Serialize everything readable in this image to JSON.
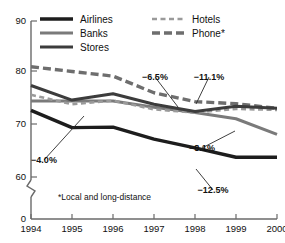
{
  "chart_data": {
    "type": "line",
    "title": "",
    "xlabel": "",
    "ylabel": "",
    "x": [
      "1994",
      "1995",
      "1996",
      "1997",
      "1998",
      "1999",
      "2000"
    ],
    "ylim": [
      60,
      90
    ],
    "axis_break": true,
    "zero_tick": "0",
    "yticks": [
      "90",
      "80",
      "70",
      "60"
    ],
    "ytick_values": [
      90,
      80,
      70,
      60
    ],
    "grid": false,
    "legend_position": "top-center",
    "series": [
      {
        "name": "Airlines",
        "style": "solid",
        "weight": "heavy",
        "color": "#1d1d1d",
        "values": [
          72.8,
          69.5,
          69.6,
          67.3,
          65.6,
          63.8,
          63.8
        ]
      },
      {
        "name": "Banks",
        "style": "solid",
        "weight": "medium",
        "color": "#7a7a7a",
        "values": [
          74.6,
          74.6,
          74.6,
          73.4,
          72.4,
          71.2,
          68.2
        ]
      },
      {
        "name": "Stores",
        "style": "solid",
        "weight": "medium",
        "color": "#3c3c3c",
        "values": [
          77.6,
          74.8,
          76.0,
          74.0,
          72.6,
          73.6,
          73.2
        ]
      },
      {
        "name": "Hotels",
        "style": "dotted",
        "weight": "light",
        "color": "#9a9a9a",
        "values": [
          75.8,
          74.0,
          74.7,
          73.0,
          72.4,
          73.1,
          72.9
        ]
      },
      {
        "name": "Phone*",
        "style": "dashed",
        "weight": "heavy",
        "color": "#6e6e6e",
        "values": [
          81.2,
          80.3,
          79.4,
          76.2,
          74.5,
          74.1,
          73.2
        ]
      }
    ],
    "annotations": [
      {
        "label": "−4.0%",
        "series": "Hotels",
        "lx": 44,
        "ly": 160,
        "tx": 84,
        "ty": 116
      },
      {
        "label": "−6.5%",
        "series": "Stores",
        "lx": 155,
        "ly": 77,
        "tx": 178,
        "ty": 107
      },
      {
        "label": "−11.1%",
        "series": "Phone*",
        "lx": 209,
        "ly": 77,
        "tx": 196,
        "ty": 104
      },
      {
        "label": "−8.1%",
        "series": "Banks",
        "lx": 202,
        "ly": 148,
        "tx": 235,
        "ty": 131
      },
      {
        "label": "−12.5%",
        "series": "Airlines",
        "lx": 213,
        "ly": 190,
        "tx": 196,
        "ty": 169
      }
    ],
    "footnote": "*Local and long-distance"
  },
  "legend": {
    "entries": [
      {
        "label": "Airlines",
        "key": "airlines"
      },
      {
        "label": "Banks",
        "key": "banks"
      },
      {
        "label": "Stores",
        "key": "stores"
      },
      {
        "label": "Hotels",
        "key": "hotels"
      },
      {
        "label": "Phone*",
        "key": "phone"
      }
    ]
  }
}
